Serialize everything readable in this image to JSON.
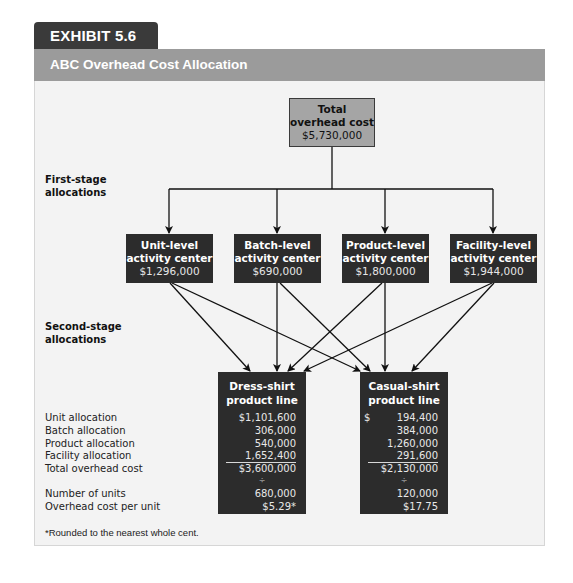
{
  "exhibit": {
    "label": "EXHIBIT 5.6",
    "title": "ABC Overhead Cost Allocation"
  },
  "colors": {
    "tab": "#3a3a3a",
    "title_bar": "#9b9b9b",
    "panel": "#f3f3f3",
    "top_box": "#a5a5a5",
    "dark_box": "#2c2c2c"
  },
  "top_box": {
    "line1": "Total",
    "line2": "overhead cost",
    "value": "$5,730,000"
  },
  "stage_labels": {
    "first": {
      "line1": "First-stage",
      "line2": "allocations"
    },
    "second": {
      "line1": "Second-stage",
      "line2": "allocations"
    }
  },
  "activity_centers": [
    {
      "line1": "Unit-level",
      "line2": "activity center",
      "value": "$1,296,000"
    },
    {
      "line1": "Batch-level",
      "line2": "activity center",
      "value": "$690,000"
    },
    {
      "line1": "Product-level",
      "line2": "activity center",
      "value": "$1,800,000"
    },
    {
      "line1": "Facility-level",
      "line2": "activity center",
      "value": "$1,944,000"
    }
  ],
  "product_lines": [
    {
      "line1": "Dress-shirt",
      "line2": "product line",
      "unit_allocation": "$1,101,600",
      "batch_allocation": "306,000",
      "product_allocation": "540,000",
      "facility_allocation": "1,652,400",
      "total_overhead_cost": "$3,600,000",
      "divide_symbol": "÷",
      "number_of_units": "680,000",
      "overhead_cost_per_unit": "$5.29*"
    },
    {
      "line1": "Casual-shirt",
      "line2": "product line",
      "unit_allocation_symbol": "$",
      "unit_allocation": "194,400",
      "batch_allocation": "384,000",
      "product_allocation": "1,260,000",
      "facility_allocation": "291,600",
      "total_overhead_cost": "$2,130,000",
      "divide_symbol": "÷",
      "number_of_units": "120,000",
      "overhead_cost_per_unit": "$17.75"
    }
  ],
  "row_labels": {
    "unit_allocation": "Unit allocation",
    "batch_allocation": "Batch allocation",
    "product_allocation": "Product allocation",
    "facility_allocation": "Facility allocation",
    "total_overhead_cost": "Total overhead cost",
    "number_of_units": "Number of units",
    "overhead_cost_per_unit": "Overhead cost per unit"
  },
  "footnote": "*Rounded to the nearest whole cent."
}
